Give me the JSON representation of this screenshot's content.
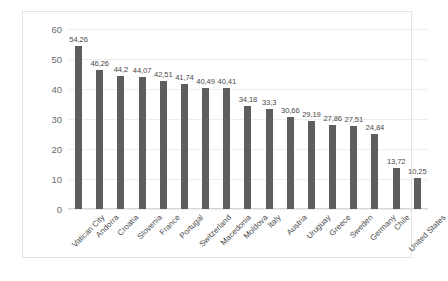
{
  "chart_data": {
    "type": "bar",
    "title": "",
    "subtitle": "",
    "xlabel": "",
    "ylabel": "",
    "ylim": [
      0,
      60
    ],
    "yticks": [
      0,
      10,
      20,
      30,
      40,
      50,
      60
    ],
    "grid": true,
    "legend": false,
    "legend_position": "none",
    "decimal_separator": ",",
    "bar_color": "#5e5e5e",
    "categories": [
      "Vatican City",
      "Andorra",
      "Croatia",
      "Slovenia",
      "France",
      "Portugal",
      "Switzerland",
      "Macedonia",
      "Moldova",
      "Italy",
      "Austria",
      "Uruguay",
      "Greece",
      "Sweden",
      "Germany",
      "Chile",
      "United States"
    ],
    "values": [
      54.26,
      46.26,
      44.2,
      44.07,
      42.51,
      41.74,
      40.49,
      40.41,
      34.18,
      33.3,
      30.66,
      29.19,
      27.86,
      27.51,
      24.84,
      13.72,
      10.25
    ],
    "data_labels": [
      "54,26",
      "46,26",
      "44,2",
      "44,07",
      "42,51",
      "41,74",
      "40,49",
      "40,41",
      "34,18",
      "33,3",
      "30,66",
      "29,19",
      "27,86",
      "27,51",
      "24,84",
      "13,72",
      "10,25"
    ]
  }
}
